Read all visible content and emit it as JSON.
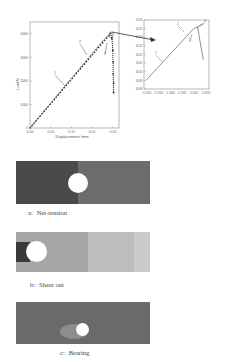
{
  "chart_data": [
    {
      "type": "line",
      "name": "main",
      "title": "",
      "xlabel": "Displacement /mm",
      "ylabel": "Load/N",
      "xlim": [
        0.0,
        0.215
      ],
      "ylim": [
        0,
        4500
      ],
      "xticks": [
        "0.00",
        "0.05",
        "0.10",
        "0.15",
        "0.20"
      ],
      "yticks": [
        "0",
        "1000",
        "2000",
        "3000",
        "4000"
      ],
      "series": [
        {
          "name": "load-displacement",
          "x": [
            0.0,
            0.02,
            0.04,
            0.06,
            0.08,
            0.1,
            0.12,
            0.14,
            0.16,
            0.18,
            0.195,
            0.198,
            0.2,
            0.201,
            0.202
          ],
          "y": [
            0,
            420,
            840,
            1260,
            1680,
            2100,
            2520,
            2940,
            3360,
            3780,
            4015,
            3800,
            3300,
            2300,
            1500
          ]
        }
      ],
      "annotations": [
        "1",
        "2",
        "3"
      ]
    },
    {
      "type": "line",
      "name": "inset",
      "xlim": [
        0.1918,
        0.1952
      ],
      "ylim": [
        4008,
        4016
      ],
      "xticks": [
        "0.1920",
        "0.1930",
        "0.1940",
        "0.1941",
        "0.1942",
        "0.1950"
      ],
      "yticks": [
        "4008",
        "4009",
        "4010",
        "4011",
        "4012",
        "4013",
        "4014",
        "4015",
        "4016"
      ],
      "series": [
        {
          "name": "zoomed-peak",
          "x": [
            0.1919,
            0.1944,
            0.1946,
            0.1949
          ],
          "y": [
            4009,
            4015,
            4015.2,
            4015.6
          ]
        },
        {
          "name": "drop",
          "x": [
            0.1946,
            0.1949
          ],
          "y": [
            4015.2,
            4011.4
          ]
        }
      ],
      "annotations": [
        "1",
        "2",
        "3",
        "4"
      ]
    }
  ],
  "panels": [
    {
      "prefix": "a:",
      "label": "Net-tension"
    },
    {
      "prefix": "b:",
      "label": "Shear out"
    },
    {
      "prefix": "c:",
      "label": "Bearing"
    }
  ],
  "colors": {
    "dark": "#4a4a4a",
    "mid": "#6a6a6a",
    "light": "#a8a8a8",
    "lighter": "#c4c4c4"
  }
}
